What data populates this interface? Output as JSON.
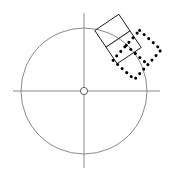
{
  "canvas": {
    "width": 176,
    "height": 178,
    "background": "#ffffff",
    "label": "CAD rotate preview canvas"
  },
  "colors": {
    "construction_line": "#8c8c8c",
    "circle_stroke": "#8a8a8a",
    "shape_outline": "#1b1b1b",
    "selection_dotted": "#000000",
    "center_marker_fill": "#ffffff",
    "center_marker_stroke": "#5e5e5e"
  },
  "geometry": {
    "circle": {
      "name": "construction-circle",
      "center_x": 84,
      "center_y": 91,
      "radius": 63,
      "stroke_width": 1
    },
    "center_marker": {
      "name": "rotation-center-marker",
      "center_x": 84,
      "center_y": 91,
      "radius": 3.6,
      "stroke_width": 1
    },
    "axis_horizontal": {
      "name": "horizontal-axis",
      "x1": 13,
      "y1": 91,
      "x2": 160,
      "y2": 91,
      "stroke_width": 1
    },
    "axis_vertical": {
      "name": "vertical-axis",
      "x1": 84,
      "y1": 13,
      "x2": 84,
      "y2": 168,
      "stroke_width": 1
    },
    "source_rectangle": {
      "name": "source-rectangle",
      "center_x": 118,
      "center_y": 39,
      "width": 29,
      "height": 40,
      "rotation_deg": -34,
      "divider_offset": 0.5,
      "stroke_width": 1,
      "style": "solid"
    },
    "rotated_rectangle": {
      "name": "rotated-selection-rectangle",
      "center_x": 137,
      "center_y": 55,
      "width": 29,
      "height": 40,
      "rotation_deg": 42,
      "divider_offset": 0.5,
      "stroke_width": 3,
      "style": "dotted",
      "dash_pattern": "0.1 6"
    }
  },
  "labels": {
    "diagram_title": "",
    "annotations": []
  }
}
